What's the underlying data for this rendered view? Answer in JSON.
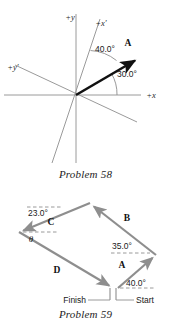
{
  "page": {
    "background": "#ffffff",
    "width": 171,
    "height": 326
  },
  "figure_58": {
    "name": "coordinate-axes-vector-diagram",
    "caption": "Problem 58",
    "axis_color": "#9a9a9a",
    "vector_color": "#111111",
    "arc_color": "#8d8d8d",
    "origin": {
      "x": 76,
      "y": 95
    },
    "labels": {
      "plus_y": "+y",
      "plus_x_prime": "+x′",
      "plus_y_prime": "+y′",
      "plus_x": "+x",
      "vector_a": "A"
    },
    "angles": [
      {
        "id": "angle-40",
        "label": "40.0°",
        "value": 40.0,
        "from_axis": "x-prime",
        "x": 95,
        "y": 49
      },
      {
        "id": "angle-30",
        "label": "30.0°",
        "value": 30.0,
        "from_axis": "x",
        "x": 117,
        "y": 74
      }
    ],
    "axes": [
      {
        "id": "y-axis",
        "label": "+y",
        "x1": 76,
        "y1": 14,
        "x2": 76,
        "y2": 163
      },
      {
        "id": "x-axis",
        "label": "+x",
        "x1": 4,
        "y1": 95,
        "x2": 141,
        "y2": 95
      },
      {
        "id": "x-prime-axis",
        "label": "+x′",
        "x1": 100,
        "y1": 19,
        "x2": 52,
        "y2": 163
      },
      {
        "id": "y-prime-axis",
        "label": "+y′",
        "x1": 15,
        "y1": 65,
        "x2": 137,
        "y2": 122
      }
    ],
    "vector": {
      "id": "vector-a",
      "x1": 76,
      "y1": 95,
      "x2": 139,
      "y2": 58
    }
  },
  "figure_59": {
    "name": "vector-loop-parallelogram-diagram",
    "caption": "Problem 59",
    "vector_color": "#8e8e8e",
    "dash_color": "#8e8e8e",
    "points": {
      "start": {
        "x": 118,
        "y": 103
      },
      "right": {
        "x": 156,
        "y": 70
      },
      "top": {
        "x": 90,
        "y": 18
      },
      "left": {
        "x": 19,
        "y": 47
      },
      "finish": {
        "x": 113,
        "y": 103
      }
    },
    "vectors": [
      {
        "id": "vector-a",
        "label": "A",
        "label_x": 122,
        "label_y": 79,
        "x1": 118,
        "y1": 103,
        "x2": 156,
        "y2": 70
      },
      {
        "id": "vector-b",
        "label": "B",
        "label_x": 127,
        "label_y": 32,
        "x1": 156,
        "y1": 70,
        "x2": 90,
        "y2": 18
      },
      {
        "id": "vector-c",
        "label": "C",
        "label_x": 51,
        "label_y": 36,
        "x1": 90,
        "y1": 18,
        "x2": 19,
        "y2": 47
      },
      {
        "id": "vector-d",
        "label": "D",
        "label_x": 57,
        "label_y": 84,
        "x1": 19,
        "y1": 47,
        "x2": 113,
        "y2": 103
      }
    ],
    "angles": [
      {
        "id": "angle-40",
        "label": "40.0°",
        "value": 40.0,
        "x": 128,
        "y": 100
      },
      {
        "id": "angle-35",
        "label": "35.0°",
        "value": 35.0,
        "x": 113,
        "y": 62
      },
      {
        "id": "angle-23",
        "label": "23.0°",
        "value": 23.0,
        "x": 34,
        "y": 17
      },
      {
        "id": "angle-theta",
        "label": "θ",
        "x": 32,
        "y": 57
      }
    ],
    "endpoints": {
      "finish_label": "Finish",
      "start_label": "Start",
      "finish_x": 60,
      "finish_y": 119,
      "start_x": 122,
      "start_y": 119
    }
  }
}
